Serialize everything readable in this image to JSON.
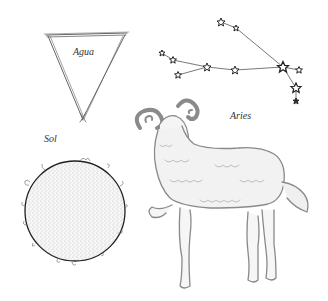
{
  "labels": {
    "agua": "Agua",
    "aries": "Aries",
    "sol": "Sol"
  },
  "colors": {
    "ink": "#555555",
    "dark_ink": "#222222",
    "sun_fill": "#f4f4f4",
    "ram_ink": "#8a8a8a",
    "background": "#ffffff"
  },
  "constellation": {
    "name": "Aries",
    "stars": [
      {
        "x": 221,
        "y": 22,
        "r": 4
      },
      {
        "x": 236,
        "y": 28,
        "r": 3
      },
      {
        "x": 162,
        "y": 53,
        "r": 3
      },
      {
        "x": 173,
        "y": 60,
        "r": 3.5
      },
      {
        "x": 178,
        "y": 75,
        "r": 3.5
      },
      {
        "x": 207,
        "y": 67,
        "r": 4
      },
      {
        "x": 235,
        "y": 70,
        "r": 4
      },
      {
        "x": 283,
        "y": 67,
        "r": 5.5
      },
      {
        "x": 299,
        "y": 70,
        "r": 3.5
      },
      {
        "x": 296,
        "y": 88,
        "r": 5
      },
      {
        "x": 296,
        "y": 101,
        "r": 3
      }
    ]
  }
}
